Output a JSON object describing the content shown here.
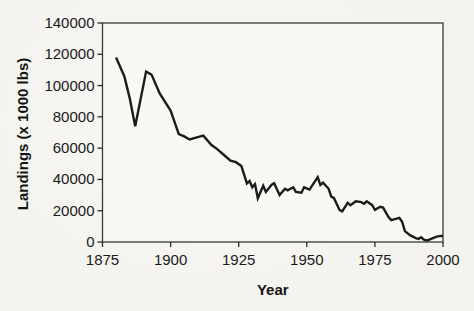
{
  "figure": {
    "kind": "scanned line chart",
    "background_color": "#f5f4f1",
    "plot_background_color": "#f9f8f5",
    "line_color": "#1c1c1c",
    "frame_color": "#3a3a3a",
    "tick_color": "#2b2b2b",
    "text_color": "#1b1b1b"
  },
  "chart_data": {
    "type": "line",
    "title": "",
    "xlabel": "Year",
    "ylabel": "Landings (x 1000 lbs)",
    "xlim": [
      1875,
      2000
    ],
    "ylim": [
      0,
      140000
    ],
    "x_ticks": [
      1875,
      1900,
      1925,
      1950,
      1975,
      2000
    ],
    "y_ticks": [
      0,
      20000,
      40000,
      60000,
      80000,
      100000,
      120000,
      140000
    ],
    "grid": false,
    "legend": false,
    "frame": true,
    "series": [
      {
        "name": "Landings (x 1000 lbs)",
        "points": [
          [
            1880,
            118000
          ],
          [
            1883,
            106000
          ],
          [
            1885,
            92000
          ],
          [
            1887,
            74000
          ],
          [
            1891,
            109000
          ],
          [
            1893,
            107000
          ],
          [
            1896,
            95000
          ],
          [
            1900,
            84000
          ],
          [
            1903,
            69000
          ],
          [
            1905,
            67500
          ],
          [
            1907,
            65500
          ],
          [
            1910,
            67000
          ],
          [
            1912,
            68000
          ],
          [
            1915,
            62000
          ],
          [
            1917,
            59500
          ],
          [
            1920,
            55000
          ],
          [
            1922,
            52000
          ],
          [
            1924,
            51000
          ],
          [
            1926,
            48500
          ],
          [
            1928,
            37500
          ],
          [
            1929,
            39000
          ],
          [
            1930,
            35000
          ],
          [
            1931,
            37000
          ],
          [
            1932,
            28000
          ],
          [
            1934,
            36000
          ],
          [
            1935,
            32000
          ],
          [
            1937,
            36500
          ],
          [
            1938,
            37500
          ],
          [
            1940,
            30000
          ],
          [
            1942,
            34000
          ],
          [
            1943,
            33000
          ],
          [
            1945,
            35000
          ],
          [
            1946,
            32000
          ],
          [
            1948,
            31500
          ],
          [
            1949,
            35000
          ],
          [
            1951,
            33500
          ],
          [
            1954,
            41500
          ],
          [
            1955,
            36500
          ],
          [
            1956,
            38000
          ],
          [
            1958,
            34000
          ],
          [
            1959,
            29000
          ],
          [
            1960,
            28000
          ],
          [
            1962,
            20500
          ],
          [
            1963,
            19500
          ],
          [
            1965,
            25000
          ],
          [
            1966,
            23500
          ],
          [
            1968,
            26000
          ],
          [
            1970,
            25500
          ],
          [
            1971,
            24500
          ],
          [
            1972,
            26000
          ],
          [
            1974,
            23500
          ],
          [
            1975,
            20500
          ],
          [
            1977,
            22500
          ],
          [
            1978,
            22000
          ],
          [
            1980,
            16000
          ],
          [
            1981,
            14000
          ],
          [
            1982,
            14500
          ],
          [
            1984,
            15500
          ],
          [
            1985,
            13000
          ],
          [
            1986,
            7000
          ],
          [
            1988,
            4200
          ],
          [
            1990,
            2500
          ],
          [
            1991,
            2000
          ],
          [
            1992,
            3000
          ],
          [
            1993,
            1500
          ],
          [
            1994,
            1000
          ],
          [
            1995,
            1500
          ],
          [
            1997,
            3000
          ],
          [
            1998,
            3600
          ],
          [
            2000,
            4000
          ]
        ]
      }
    ]
  }
}
